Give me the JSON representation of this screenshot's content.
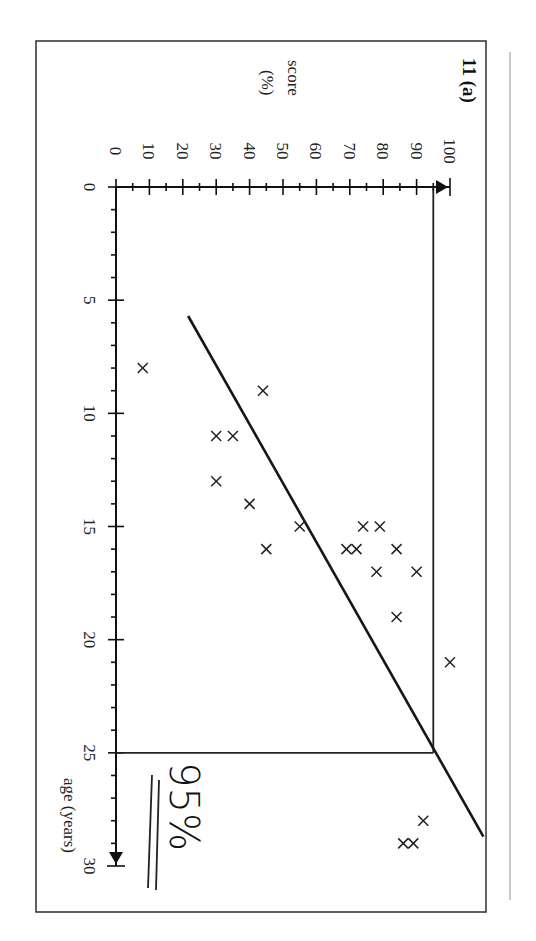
{
  "figure": {
    "question_label": "11 (a)",
    "annotation": "95%",
    "orientation": "rotated 90° clockwise"
  },
  "chart_data": {
    "type": "scatter",
    "title": "11 (a)",
    "xlabel": "age (years)",
    "ylabel": "score (%)",
    "ylabel_lines": [
      "score",
      "(%)"
    ],
    "xlim": [
      0,
      30
    ],
    "ylim": [
      0,
      100
    ],
    "x_ticks": [
      0,
      5,
      10,
      15,
      20,
      25,
      30
    ],
    "y_ticks": [
      0,
      10,
      20,
      30,
      40,
      50,
      60,
      70,
      80,
      90,
      100
    ],
    "grid": false,
    "marker": "x",
    "points": [
      {
        "x": 8,
        "y": 8
      },
      {
        "x": 9,
        "y": 44
      },
      {
        "x": 11,
        "y": 30
      },
      {
        "x": 11,
        "y": 35
      },
      {
        "x": 13,
        "y": 30
      },
      {
        "x": 14,
        "y": 40
      },
      {
        "x": 15,
        "y": 55
      },
      {
        "x": 15,
        "y": 74
      },
      {
        "x": 15,
        "y": 79
      },
      {
        "x": 16,
        "y": 45
      },
      {
        "x": 16,
        "y": 69
      },
      {
        "x": 16,
        "y": 72
      },
      {
        "x": 16,
        "y": 84
      },
      {
        "x": 17,
        "y": 78
      },
      {
        "x": 17,
        "y": 90
      },
      {
        "x": 19,
        "y": 84
      },
      {
        "x": 21,
        "y": 100
      },
      {
        "x": 28,
        "y": 92
      },
      {
        "x": 29,
        "y": 86
      },
      {
        "x": 29,
        "y": 89
      }
    ],
    "line_of_best_fit": {
      "from": {
        "x": 5.7,
        "y": 21.6
      },
      "to": {
        "x": 28.7,
        "y": 110
      }
    },
    "reference_lines": [
      {
        "from": {
          "x": 25,
          "y": 0
        },
        "to": {
          "x": 25,
          "y": 95
        }
      },
      {
        "from": {
          "x": 0,
          "y": 95
        },
        "to": {
          "x": 25,
          "y": 95
        }
      }
    ],
    "annotation": {
      "text": "95%",
      "underlined": "double"
    }
  }
}
